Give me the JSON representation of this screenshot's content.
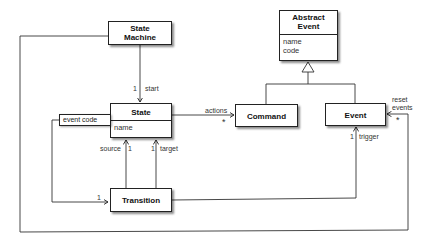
{
  "diagram": {
    "type": "UML class diagram",
    "classes": {
      "state_machine": {
        "title_line1": "State",
        "title_line2": "Machine"
      },
      "state": {
        "title": "State",
        "attributes": [
          "name"
        ],
        "qualifier": "event code"
      },
      "abstract_event": {
        "title_line1": "Abstract",
        "title_line2": "Event",
        "attributes": [
          "name",
          "code"
        ]
      },
      "command": {
        "title": "Command"
      },
      "event": {
        "title": "Event"
      },
      "transition": {
        "title": "Transition"
      }
    },
    "associations": {
      "start": {
        "multiplicity": "1",
        "role": "start"
      },
      "actions": {
        "role": "actions",
        "multiplicity": "*"
      },
      "reset_events": {
        "role_line1": "reset",
        "role_line2": "events",
        "multiplicity": "*"
      },
      "source": {
        "role": "source",
        "multiplicity": "1"
      },
      "target": {
        "role": "target",
        "multiplicity": "1"
      },
      "trigger": {
        "role": "trigger",
        "multiplicity": "1"
      },
      "transitions": {
        "multiplicity": "1"
      }
    }
  }
}
